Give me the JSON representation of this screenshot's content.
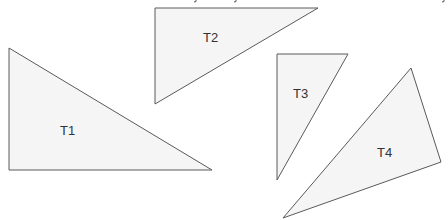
{
  "diagram": {
    "type": "geometric-shapes",
    "shapes": [
      {
        "id": "T1",
        "label": "T1",
        "kind": "right-triangle",
        "points": [
          [
            9,
            48
          ],
          [
            212,
            170
          ],
          [
            9,
            170
          ]
        ],
        "label_pos": [
          60,
          135
        ]
      },
      {
        "id": "T2",
        "label": "T2",
        "kind": "right-triangle",
        "points": [
          [
            155,
            8
          ],
          [
            318,
            8
          ],
          [
            155,
            104
          ]
        ],
        "label_pos": [
          203,
          42
        ]
      },
      {
        "id": "T3",
        "label": "T3",
        "kind": "right-triangle",
        "points": [
          [
            277,
            54
          ],
          [
            348,
            54
          ],
          [
            277,
            180
          ]
        ],
        "label_pos": [
          293,
          98
        ]
      },
      {
        "id": "T4",
        "label": "T4",
        "kind": "triangle",
        "points": [
          [
            411,
            68
          ],
          [
            441,
            162
          ],
          [
            283,
            218
          ]
        ],
        "label_pos": [
          377,
          157
        ]
      }
    ],
    "colors": {
      "fill": "#f5f5f5",
      "stroke": "#5a5a5a",
      "text": "#333333",
      "background": "#ffffff"
    }
  }
}
